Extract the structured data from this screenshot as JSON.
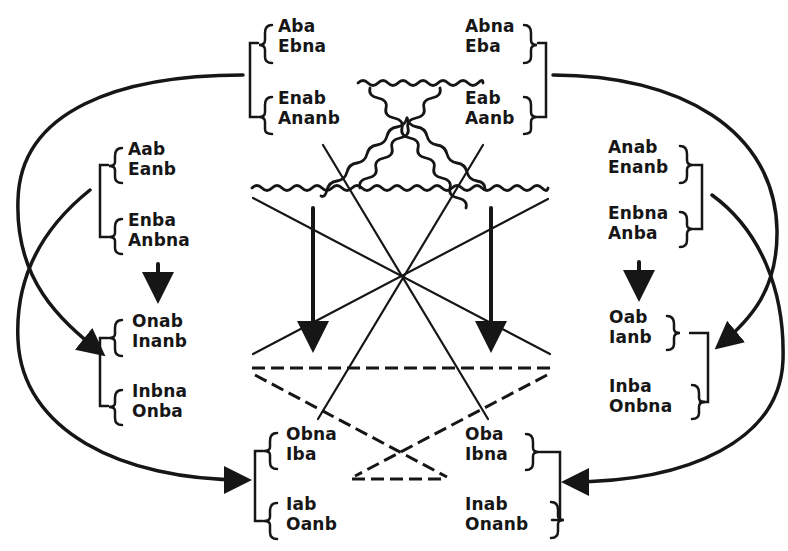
{
  "diagram": {
    "kind": "syllogistic mood transformation scheme",
    "ink_color": "#161616",
    "background": "#ffffff",
    "groups": {
      "top_left": {
        "pairs": [
          [
            "Aba",
            "Ebna"
          ],
          [
            "Enab",
            "Ananb"
          ]
        ]
      },
      "top_right": {
        "pairs": [
          [
            "Abna",
            "Eba"
          ],
          [
            "Eab",
            "Aanb"
          ]
        ]
      },
      "mid_left_upper": {
        "pairs": [
          [
            "Aab",
            "Eanb"
          ],
          [
            "Enba",
            "Anbna"
          ]
        ]
      },
      "mid_right_upper": {
        "pairs": [
          [
            "Anab",
            "Enanb"
          ],
          [
            "Enbna",
            "Anba"
          ]
        ]
      },
      "mid_left_lower": {
        "pairs": [
          [
            "Onab",
            "Inanb"
          ],
          [
            "Inbna",
            "Onba"
          ]
        ]
      },
      "mid_right_lower": {
        "pairs": [
          [
            "Oab",
            "Ianb"
          ],
          [
            "Inba",
            "Onbna"
          ]
        ]
      },
      "bottom_left": {
        "pairs": [
          [
            "Obna",
            "Iba"
          ],
          [
            "Iab",
            "Oanb"
          ]
        ]
      },
      "bottom_right": {
        "pairs": [
          [
            "Oba",
            "Ibna"
          ],
          [
            "Inab",
            "Onanb"
          ]
        ]
      }
    },
    "connections": [
      {
        "from": "top_left",
        "to": "mid_left_lower",
        "style": "curved-arrow"
      },
      {
        "from": "mid_left_upper",
        "to": "bottom_left",
        "style": "curved-arrow"
      },
      {
        "from": "top_right",
        "to": "mid_right_lower",
        "style": "curved-arrow"
      },
      {
        "from": "mid_right_upper",
        "to": "bottom_right",
        "style": "curved-arrow"
      },
      {
        "from": "mid_left_upper",
        "to": "mid_left_lower",
        "style": "straight-arrow"
      },
      {
        "from": "mid_right_upper",
        "to": "mid_right_lower",
        "style": "straight-arrow"
      }
    ],
    "line_styles": [
      "wavy",
      "solid",
      "dashed"
    ]
  }
}
